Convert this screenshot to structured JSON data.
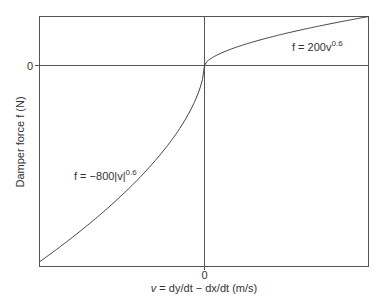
{
  "chart_data": {
    "type": "line",
    "title": "",
    "xlabel": "v = dy/dt − dx/dt  (m/s)",
    "ylabel": "Damper force f (N)",
    "x_ticks": [
      "0"
    ],
    "y_ticks": [
      "0"
    ],
    "xlim": [
      -1,
      1
    ],
    "ylim": [
      -820,
      200
    ],
    "grid": false,
    "series": [
      {
        "name": "compression",
        "equation": "f = 200v^0.6",
        "domain": [
          0,
          1
        ],
        "coef": 200,
        "exponent": 0.6,
        "x": [
          0,
          0.1,
          0.2,
          0.3,
          0.4,
          0.5,
          0.6,
          0.7,
          0.8,
          0.9,
          1.0
        ],
        "values": [
          0,
          50.2,
          76.2,
          97.0,
          115.1,
          131.9,
          147.0,
          161.5,
          175.0,
          187.9,
          200
        ]
      },
      {
        "name": "rebound",
        "equation": "f = −800|v|^0.6",
        "domain": [
          -1,
          0
        ],
        "coef": -800,
        "exponent": 0.6,
        "x": [
          -1.0,
          -0.9,
          -0.8,
          -0.7,
          -0.6,
          -0.5,
          -0.4,
          -0.3,
          -0.2,
          -0.1,
          0
        ],
        "values": [
          -800,
          -751.6,
          -700.2,
          -646.0,
          -588.2,
          -527.8,
          -460.5,
          -388.0,
          -304.8,
          -201.0,
          0
        ]
      }
    ],
    "annotations": [
      {
        "text_main": "f = 200v",
        "text_sup": "0.6",
        "series": "compression"
      },
      {
        "text_main": "f = −800|v|",
        "text_sup": "0.6",
        "series": "rebound"
      }
    ]
  },
  "labels": {
    "y_zero": "0",
    "x_zero": "0",
    "ylabel": "Damper force f (N)",
    "xlabel_v": "v",
    "xlabel_rest": " = dy/dt − dx/dt  (m/s)",
    "ann_right_main": "f = 200v",
    "ann_right_sup": "0.6",
    "ann_left_main": "f = −800|v|",
    "ann_left_sup": "0.6"
  }
}
